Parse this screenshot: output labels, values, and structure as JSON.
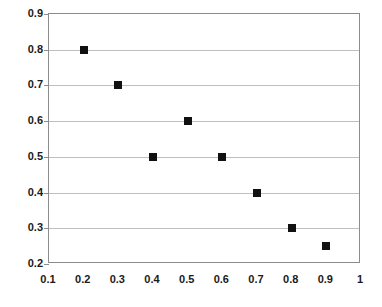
{
  "chart_data": {
    "type": "scatter",
    "title": "",
    "subtitle": "",
    "xlabel": "",
    "ylabel": "",
    "xlim": [
      0.1,
      1.0
    ],
    "ylim": [
      0.2,
      0.9
    ],
    "grid": "horizontal",
    "legend": "none",
    "marker": "filled-square",
    "marker_color": "#111111",
    "x": [
      0.2,
      0.3,
      0.4,
      0.5,
      0.6,
      0.7,
      0.8,
      0.9
    ],
    "y": [
      0.8,
      0.7,
      0.5,
      0.6,
      0.5,
      0.4,
      0.3,
      0.25
    ],
    "points": [
      {
        "x": 0.2,
        "y": 0.8
      },
      {
        "x": 0.3,
        "y": 0.7
      },
      {
        "x": 0.4,
        "y": 0.5
      },
      {
        "x": 0.5,
        "y": 0.6
      },
      {
        "x": 0.6,
        "y": 0.5
      },
      {
        "x": 0.7,
        "y": 0.4
      },
      {
        "x": 0.8,
        "y": 0.3
      },
      {
        "x": 0.9,
        "y": 0.25
      }
    ],
    "xticks": [
      0.1,
      0.2,
      0.3,
      0.4,
      0.5,
      0.6,
      0.7,
      0.8,
      0.9,
      1.0
    ],
    "xtick_labels": [
      "0.1",
      "0.2",
      "0.3",
      "0.4",
      "0.5",
      "0.6",
      "0.7",
      "0.8",
      "0.9",
      "1"
    ],
    "yticks": [
      0.2,
      0.3,
      0.4,
      0.5,
      0.6,
      0.7,
      0.8,
      0.9
    ],
    "ytick_labels": [
      "0.2",
      "0.3",
      "0.4",
      "0.5",
      "0.6",
      "0.7",
      "0.8",
      "0.9"
    ],
    "gridline_values": [
      0.3,
      0.4,
      0.5,
      0.6,
      0.7,
      0.8
    ],
    "colors": {
      "background": "#ffffff",
      "plot_border": "#8c8c8c",
      "gridline": "#bfbfbf",
      "marker": "#111111",
      "tick_label": "#1a1a1a"
    }
  }
}
